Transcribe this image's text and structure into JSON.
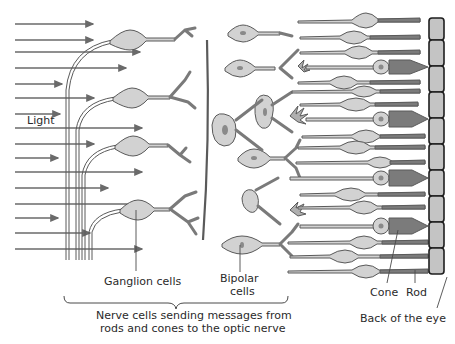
{
  "diagram": {
    "colors": {
      "stroke": "#5a5a5a",
      "cell_fill": "#d2d2d2",
      "cell_dark": "#7b7b7b",
      "nucleus": "#9a9a9a",
      "epithelium_fill": "#c4c4c4",
      "epithelium_stroke": "#1e1e1e",
      "arrow": "#6a6a6a",
      "background": "#ffffff"
    },
    "labels": {
      "light": "Light",
      "ganglion": "Ganglion cells",
      "bipolar_1": "Bipolar",
      "bipolar_2": "cells",
      "cone": "Cone",
      "rod": "Rod",
      "back_of_eye": "Back of the eye",
      "brace_1": "Nerve cells sending messages from",
      "brace_2": "rods and cones to the optic nerve"
    },
    "light_arrows_count": 14,
    "photoreceptors": [
      "rod",
      "rod",
      "rod",
      "cone",
      "rod",
      "rod",
      "rod",
      "cone",
      "rod",
      "rod",
      "rod",
      "cone",
      "rod",
      "rod",
      "rod",
      "rod"
    ],
    "epithelium_cells": 11
  }
}
